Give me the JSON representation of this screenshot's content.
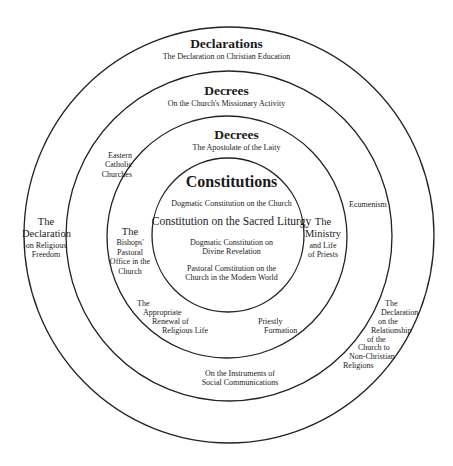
{
  "rings": [
    {
      "name": "declarations-ring",
      "cx": 229,
      "cy": 235,
      "rx": 205,
      "ry": 208
    },
    {
      "name": "decrees-outer-ring",
      "cx": 229,
      "cy": 236,
      "rx": 163,
      "ry": 165
    },
    {
      "name": "decrees-inner-ring",
      "cx": 227,
      "cy": 237,
      "rx": 120,
      "ry": 121
    },
    {
      "name": "constitutions-ring",
      "cx": 228,
      "cy": 235,
      "rx": 76,
      "ry": 77
    }
  ],
  "stroke_color": "#222222",
  "declarations": {
    "title": "Declarations",
    "top": "The Declaration on Christian Education",
    "left": [
      "The",
      "Declaration",
      "on Religious",
      "Freedom"
    ],
    "right": [
      "The",
      "Declaration",
      "on the",
      "Relationship",
      "of the",
      "Church to",
      "Non-Christian",
      "Religions"
    ]
  },
  "decrees_outer": {
    "title": "Decrees",
    "top": "On the Church's Missionary Activity",
    "left": [
      "Eastern",
      "Catholic",
      "Churches"
    ],
    "right": "Ecumenism",
    "bottom": [
      "On the Instruments of",
      "Social Communications"
    ]
  },
  "decrees_inner": {
    "title": "Decrees",
    "top": "The Apostolate of the Laity",
    "left": [
      "The",
      "Bishops'",
      "Pastoral",
      "Office in the",
      "Church"
    ],
    "right": [
      "The",
      "Ministry",
      "and Life",
      "of Priests"
    ],
    "bottom_left": [
      "The",
      "Appropriate",
      "Renewal of",
      "Religious Life"
    ],
    "bottom_right": [
      "Priestly",
      "Formation"
    ]
  },
  "constitutions": {
    "title": "Constitutions",
    "items": [
      "Dogmatic Constitution on the Church",
      "Constitution on the Sacred Liturgy",
      [
        "Dogmatic Constitution on",
        "Divine Revelation"
      ],
      [
        "Pastoral Constitution on the",
        "Church in the Modern World"
      ]
    ]
  }
}
